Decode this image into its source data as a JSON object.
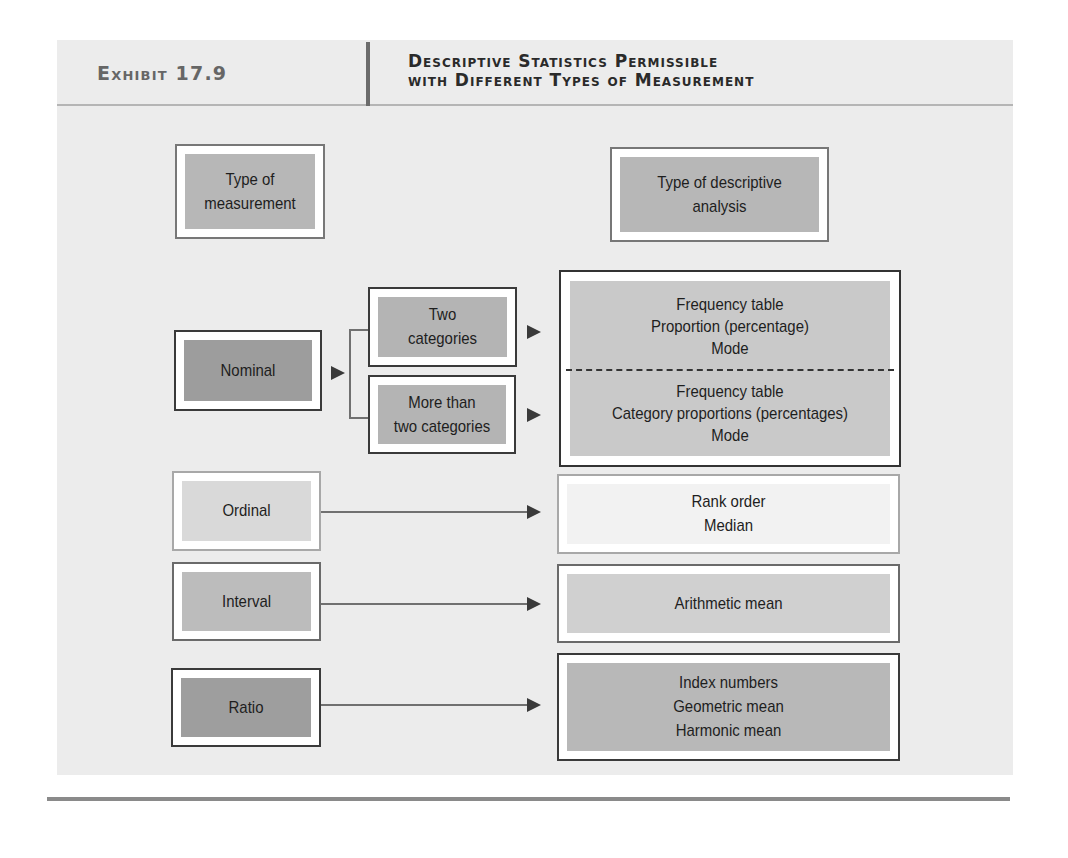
{
  "header": {
    "exhibit_label": "Exhibit 17.9",
    "title_line1": "Descriptive Statistics Permissible",
    "title_line2": "with Different Types of Measurement"
  },
  "columns": {
    "left_header": "Type of\nmeasurement",
    "right_header": "Type of descriptive\nanalysis"
  },
  "nominal": {
    "label": "Nominal",
    "branches": [
      {
        "label": "Two\ncategories",
        "analysis": "Frequency table\nProportion (percentage)\nMode"
      },
      {
        "label": "More than\ntwo categories",
        "analysis": "Frequency table\nCategory proportions (percentages)\nMode"
      }
    ]
  },
  "rows": [
    {
      "measurement": "Ordinal",
      "analysis": "Rank order\nMedian"
    },
    {
      "measurement": "Interval",
      "analysis": "Arithmetic mean"
    },
    {
      "measurement": "Ratio",
      "analysis": "Index numbers\nGeometric mean\nHarmonic mean"
    }
  ],
  "colors": {
    "panel_bg": "#ececec",
    "dark_border": "#3a3a3a",
    "nominal_fill": "#9d9d9d",
    "ratio_fill": "#9e9e9e",
    "interval_fill": "#bcbcbc",
    "ordinal_fill": "#d9d9d9"
  }
}
